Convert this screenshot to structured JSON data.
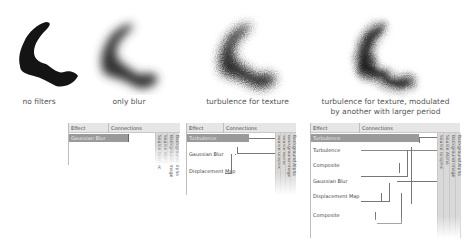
{
  "examples": [
    {
      "id": "no-filters",
      "caption": "no filters"
    },
    {
      "id": "only-blur",
      "caption": "only blur"
    },
    {
      "id": "turbulence",
      "caption": "turbulence for texture"
    },
    {
      "id": "turbulence-modulated",
      "caption_line1": "turbulence for texture, modulated",
      "caption_line2": "by another with larger period"
    }
  ],
  "panels": [
    {
      "id": "blur-panel",
      "header": {
        "effect": "Effect",
        "connections": "Connections"
      },
      "rows": [
        {
          "label": "Gaussian Blur",
          "selected": true
        }
      ],
      "inputs": [
        "Background Alpha",
        "Background Image",
        "Source Alpha",
        "Source Graphic"
      ]
    },
    {
      "id": "turbulence-panel",
      "header": {
        "effect": "Effect",
        "connections": "Connections"
      },
      "rows": [
        {
          "label": "Turbulence",
          "selected": true
        },
        {
          "label": "Gaussian Blur",
          "selected": false
        },
        {
          "label": "Displacement Map",
          "selected": false
        }
      ],
      "inputs": [
        "Background Alpha",
        "Background Image",
        "Source Alpha",
        "Source Graphic"
      ]
    },
    {
      "id": "modulated-panel",
      "header": {
        "effect": "Effect",
        "connections": "Connections"
      },
      "rows": [
        {
          "label": "Turbulence",
          "selected": true
        },
        {
          "label": "Turbulence",
          "selected": false
        },
        {
          "label": "Composite",
          "selected": false
        },
        {
          "label": "Gaussian Blur",
          "selected": false
        },
        {
          "label": "Displacement Map",
          "selected": false
        },
        {
          "label": "Composite",
          "selected": false
        }
      ],
      "inputs": [
        "Background Alpha",
        "Background Image",
        "Source Alpha",
        "Source Graphic"
      ]
    }
  ]
}
